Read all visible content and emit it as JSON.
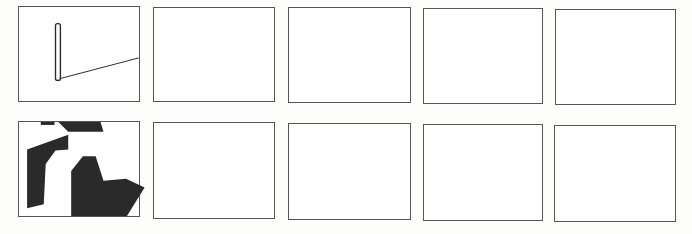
{
  "grid": {
    "rows": 2,
    "columns": 5
  },
  "colors": {
    "line": "#555555",
    "ink": "#2a2a2a",
    "paper": "#ffffff"
  },
  "panels": [
    {
      "id": "r1c1",
      "label": "Panel 1",
      "content": "vertical bar with diagonal line"
    },
    {
      "id": "r1c2",
      "label": "Panel 2",
      "content": "empty"
    },
    {
      "id": "r1c3",
      "label": "Panel 3",
      "content": "empty"
    },
    {
      "id": "r1c4",
      "label": "Panel 4",
      "content": "empty"
    },
    {
      "id": "r1c5",
      "label": "Panel 5",
      "content": "empty"
    },
    {
      "id": "r2c1",
      "label": "Panel 6",
      "content": "dark polygon shapes"
    },
    {
      "id": "r2c2",
      "label": "Panel 7",
      "content": "empty"
    },
    {
      "id": "r2c3",
      "label": "Panel 8",
      "content": "empty"
    },
    {
      "id": "r2c4",
      "label": "Panel 9",
      "content": "empty"
    },
    {
      "id": "r2c5",
      "label": "Panel 10",
      "content": "empty"
    }
  ]
}
